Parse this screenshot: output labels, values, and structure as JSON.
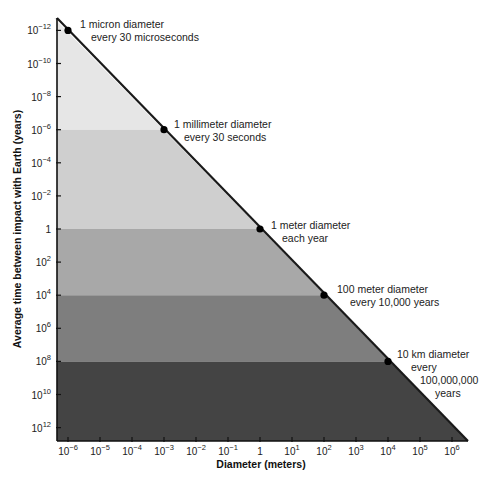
{
  "chart_data": {
    "type": "area",
    "title": "",
    "xlabel": "Diameter (meters)",
    "ylabel": "Average time between impact with Earth (years)",
    "x_scale": "log",
    "y_scale": "log",
    "y_inverted": true,
    "grid": false,
    "legend": null,
    "x_ticks": [
      {
        "exp": -6,
        "base": "10",
        "sup": "−6"
      },
      {
        "exp": -5,
        "base": "10",
        "sup": "−5"
      },
      {
        "exp": -4,
        "base": "10",
        "sup": "−4"
      },
      {
        "exp": -3,
        "base": "10",
        "sup": "−3"
      },
      {
        "exp": -2,
        "base": "10",
        "sup": "−2"
      },
      {
        "exp": -1,
        "base": "10",
        "sup": "−1"
      },
      {
        "exp": 0,
        "base": "1",
        "sup": ""
      },
      {
        "exp": 1,
        "base": "10",
        "sup": "1"
      },
      {
        "exp": 2,
        "base": "10",
        "sup": "2"
      },
      {
        "exp": 3,
        "base": "10",
        "sup": "3"
      },
      {
        "exp": 4,
        "base": "10",
        "sup": "4"
      },
      {
        "exp": 5,
        "base": "10",
        "sup": "5"
      },
      {
        "exp": 6,
        "base": "10",
        "sup": "6"
      }
    ],
    "y_ticks": [
      {
        "exp": -12,
        "base": "10",
        "sup": "−12"
      },
      {
        "exp": -10,
        "base": "10",
        "sup": "−10"
      },
      {
        "exp": -8,
        "base": "10",
        "sup": "−8"
      },
      {
        "exp": -6,
        "base": "10",
        "sup": "−6"
      },
      {
        "exp": -4,
        "base": "10",
        "sup": "−4"
      },
      {
        "exp": -2,
        "base": "10",
        "sup": "−2"
      },
      {
        "exp": 0,
        "base": "1",
        "sup": ""
      },
      {
        "exp": 2,
        "base": "10",
        "sup": "2"
      },
      {
        "exp": 4,
        "base": "10",
        "sup": "4"
      },
      {
        "exp": 6,
        "base": "10",
        "sup": "6"
      },
      {
        "exp": 8,
        "base": "10",
        "sup": "8"
      },
      {
        "exp": 10,
        "base": "10",
        "sup": "10"
      },
      {
        "exp": 12,
        "base": "10",
        "sup": "12"
      }
    ],
    "x_range_exp": [
      -6.35,
      6.4
    ],
    "y_range_exp": [
      -12.7,
      13.0
    ],
    "points": [
      {
        "diameter_m": 1e-06,
        "x_exp": -6,
        "y_exp": -12,
        "label_lines": [
          "1 micron diameter",
          "every 30 microseconds"
        ]
      },
      {
        "diameter_m": 0.001,
        "x_exp": -3,
        "y_exp": -6,
        "label_lines": [
          "1 millimeter diameter",
          "every 30 seconds"
        ]
      },
      {
        "diameter_m": 1,
        "x_exp": 0,
        "y_exp": 0,
        "label_lines": [
          "1 meter diameter",
          "each year"
        ]
      },
      {
        "diameter_m": 100,
        "x_exp": 2,
        "y_exp": 4,
        "label_lines": [
          "100 meter diameter",
          "every 10,000 years"
        ]
      },
      {
        "diameter_m": 10000,
        "x_exp": 4,
        "y_exp": 8,
        "label_lines": [
          "10 km diameter",
          "every",
          "100,000,000",
          "years"
        ]
      }
    ],
    "bands": [
      {
        "from_y_exp": -12.7,
        "to_y_exp": -6,
        "color": "#e6e6e6"
      },
      {
        "from_y_exp": -6,
        "to_y_exp": 0,
        "color": "#cfcfcf"
      },
      {
        "from_y_exp": 0,
        "to_y_exp": 4,
        "color": "#a8a8a8"
      },
      {
        "from_y_exp": 4,
        "to_y_exp": 8,
        "color": "#7e7e7e"
      },
      {
        "from_y_exp": 8,
        "to_y_exp": 13.0,
        "color": "#444444"
      }
    ],
    "line_color": "#1a1a1a",
    "marker_color": "#000000"
  }
}
